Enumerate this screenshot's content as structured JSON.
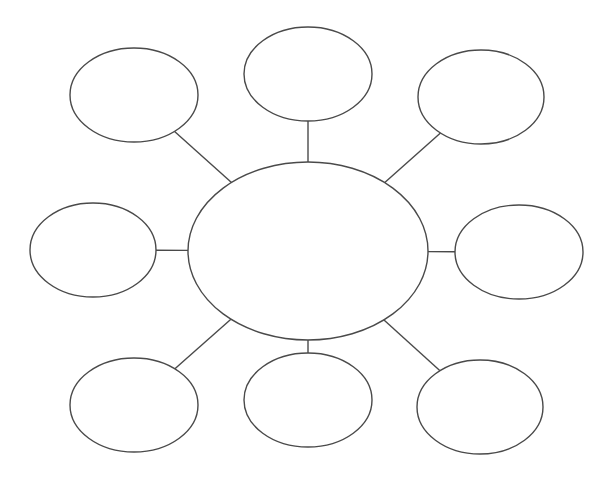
{
  "diagram": {
    "type": "bubble-map",
    "stroke_color": "#4a4a4a",
    "background_color": "#ffffff",
    "center": {
      "id": "center",
      "label": ""
    },
    "satellites": [
      {
        "id": "top-left",
        "label": ""
      },
      {
        "id": "top",
        "label": ""
      },
      {
        "id": "top-right",
        "label": ""
      },
      {
        "id": "left",
        "label": ""
      },
      {
        "id": "right",
        "label": ""
      },
      {
        "id": "bottom-left",
        "label": ""
      },
      {
        "id": "bottom",
        "label": ""
      },
      {
        "id": "bottom-right",
        "label": ""
      }
    ],
    "connections": [
      {
        "from": "center",
        "to": "top-left"
      },
      {
        "from": "center",
        "to": "top"
      },
      {
        "from": "center",
        "to": "top-right"
      },
      {
        "from": "center",
        "to": "left"
      },
      {
        "from": "center",
        "to": "right"
      },
      {
        "from": "center",
        "to": "bottom-left"
      },
      {
        "from": "center",
        "to": "bottom"
      },
      {
        "from": "center",
        "to": "bottom-right"
      }
    ]
  }
}
